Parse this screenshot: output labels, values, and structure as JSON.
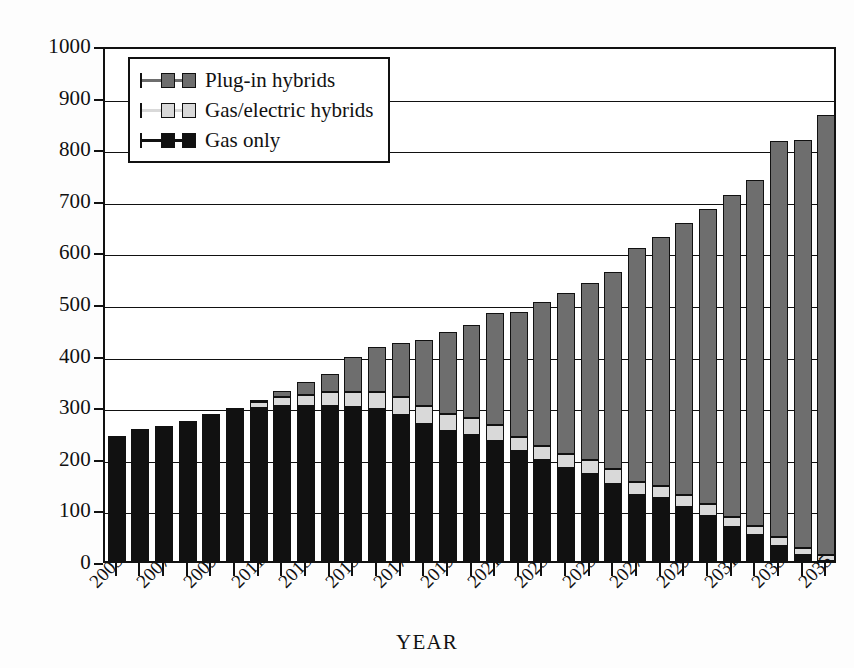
{
  "chart_data": {
    "type": "bar",
    "subtype": "stacked-vertical",
    "title": "",
    "xlabel": "YEAR",
    "ylabel": "Millions of automobiles",
    "ylim": [
      0,
      1000
    ],
    "ytick_step": 100,
    "yticks": [
      "0",
      "100",
      "200",
      "300",
      "400",
      "500",
      "600",
      "700",
      "800",
      "900",
      "1000"
    ],
    "grid": true,
    "grid_axis": "y",
    "legend_position": "upper-left-inside",
    "categories": [
      "2005",
      "2006",
      "2007",
      "2008",
      "2009",
      "2010",
      "2011",
      "2012",
      "2013",
      "2014",
      "2015",
      "2016",
      "2017",
      "2018",
      "2019",
      "2020",
      "2021",
      "2022",
      "2023",
      "2024",
      "2025",
      "2026",
      "2027",
      "2028",
      "2029",
      "2030",
      "2031",
      "2032",
      "2033",
      "2034",
      "2035"
    ],
    "xtick_labels_shown": [
      "2005",
      "2007",
      "2009",
      "2011",
      "2013",
      "2015",
      "2017",
      "2019",
      "2021",
      "2023",
      "2025",
      "2027",
      "2029",
      "2031",
      "2033",
      "2035"
    ],
    "series": [
      {
        "name": "Gas only",
        "color": "#111111",
        "values": [
          243,
          255,
          262,
          272,
          285,
          292,
          296,
          300,
          300,
          300,
          298,
          295,
          283,
          265,
          252,
          245,
          233,
          213,
          195,
          180,
          168,
          150,
          128,
          122,
          105,
          88,
          65,
          50,
          30,
          12,
          0
        ]
      },
      {
        "name": "Gas/electric hybrids",
        "color": "#d9d9d9",
        "values": [
          0,
          0,
          0,
          0,
          0,
          5,
          12,
          18,
          22,
          28,
          30,
          32,
          35,
          35,
          33,
          32,
          30,
          28,
          28,
          28,
          28,
          28,
          26,
          24,
          22,
          22,
          20,
          18,
          16,
          14,
          12
        ]
      },
      {
        "name": "Plug-in hybrids",
        "color": "#6e6e6e",
        "values": [
          0,
          0,
          0,
          0,
          0,
          0,
          2,
          12,
          25,
          35,
          68,
          88,
          105,
          128,
          158,
          180,
          218,
          242,
          278,
          312,
          342,
          382,
          452,
          482,
          528,
          572,
          625,
          670,
          768,
          790,
          853
        ]
      }
    ],
    "totals": [
      243,
      255,
      262,
      272,
      285,
      297,
      310,
      330,
      347,
      363,
      396,
      415,
      423,
      428,
      443,
      457,
      481,
      483,
      501,
      520,
      538,
      560,
      606,
      628,
      655,
      682,
      710,
      738,
      814,
      816,
      865
    ]
  },
  "legend": {
    "items": [
      {
        "label": "Plug-in hybrids",
        "swatch": "plug-in-hybrids-swatch"
      },
      {
        "label": "Gas/electric hybrids",
        "swatch": "gas-electric-hybrids-swatch"
      },
      {
        "label": "Gas only",
        "swatch": "gas-only-swatch"
      }
    ]
  },
  "colors": {
    "gas_only": "#111111",
    "gas_electric_hybrids": "#d9d9d9",
    "plug_in_hybrids": "#6e6e6e",
    "axis": "#111111",
    "background": "#ffffff"
  }
}
